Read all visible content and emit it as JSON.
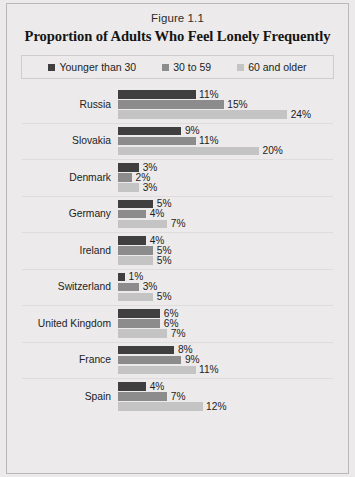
{
  "figure": {
    "number": "Figure 1.1",
    "title": "Proportion of Adults Who Feel Lonely Frequently"
  },
  "legend": {
    "items": [
      {
        "label": "Younger than 30",
        "color": "#3f3f3f"
      },
      {
        "label": "30 to 59",
        "color": "#8c8c8c"
      },
      {
        "label": "60 and older",
        "color": "#c4c4c4"
      }
    ]
  },
  "chart_data": {
    "type": "bar",
    "orientation": "horizontal",
    "title": "Proportion of Adults Who Feel Lonely Frequently",
    "subtitle": "Figure 1.1",
    "xlabel": "",
    "ylabel": "",
    "grid": false,
    "legend_position": "top",
    "value_suffix": "%",
    "xlim": [
      0,
      24
    ],
    "categories": [
      "Russia",
      "Slovakia",
      "Denmark",
      "Germany",
      "Ireland",
      "Switzerland",
      "United Kingdom",
      "France",
      "Spain"
    ],
    "series": [
      {
        "name": "Younger than 30",
        "color": "#3f3f3f",
        "values": [
          11,
          9,
          3,
          5,
          4,
          1,
          6,
          8,
          4
        ],
        "labels": [
          "11%",
          "9%",
          "3%",
          "5%",
          "4%",
          "1%",
          "6%",
          "8%",
          "4%"
        ]
      },
      {
        "name": "30 to 59",
        "color": "#8c8c8c",
        "values": [
          15,
          11,
          2,
          4,
          5,
          3,
          6,
          9,
          7
        ],
        "labels": [
          "15%",
          "11%",
          "2%",
          "4%",
          "5%",
          "3%",
          "6%",
          "9%",
          "7%"
        ]
      },
      {
        "name": "60 and older",
        "color": "#c4c4c4",
        "values": [
          24,
          20,
          3,
          7,
          5,
          5,
          7,
          11,
          12
        ],
        "labels": [
          "24%",
          "20%",
          "3%",
          "7%",
          "5%",
          "5%",
          "7%",
          "11%",
          "12%"
        ]
      }
    ]
  }
}
